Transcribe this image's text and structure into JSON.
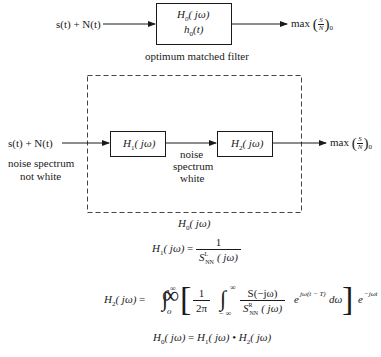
{
  "top_diagram": {
    "input_label": "s(t) + N(t)",
    "box_line1": "H0(jω)",
    "box_line2": "h0(t)",
    "caption": "optimum matched filter",
    "output_label": "max (S/N)0"
  },
  "bottom_diagram": {
    "input_label": "s(t) + N(t)",
    "input_note_line1": "noise spectrum",
    "input_note_line2": "not white",
    "box1_label": "H1(jω)",
    "middle_note_line1": "noise",
    "middle_note_line2": "spectrum",
    "middle_note_line3": "white",
    "box2_label": "H2(jω)",
    "output_label": "max (S/N)0",
    "dashed_box_label": "H0(jω)"
  },
  "equations": {
    "h1": "H1(jω) = 1 / S^L_NN(jω)",
    "h2": "H2(jω) = ∫0^∞ [ (1/2π) ∫−∞^∞ S(−jω)/S^R_NN(jω) e^{jω(t−T)} dω ] e^{−jωt} dt",
    "h0": "H0(jω) = H1(jω) • H2(jω)"
  },
  "text": {
    "H": "H",
    "h": "h",
    "jw": "( jω)",
    "t_paren": "(t)",
    "sub0": "0",
    "sub1": "1",
    "sub2": "2",
    "max": "max",
    "S": "S",
    "N": "N",
    "one": "1",
    "eq": "=",
    "SNN": "S",
    "NN": "NN",
    "L": "L",
    "R": "R",
    "twopi": "2π",
    "inf": "∞",
    "minf": "− ∞",
    "S_neg": "S(−jω)",
    "e": "e",
    "exp1": "jω(t − T)",
    "dw": "dω",
    "exp2": "−jωt",
    "dt": "dt",
    "bullet": "•",
    "o": "o"
  }
}
